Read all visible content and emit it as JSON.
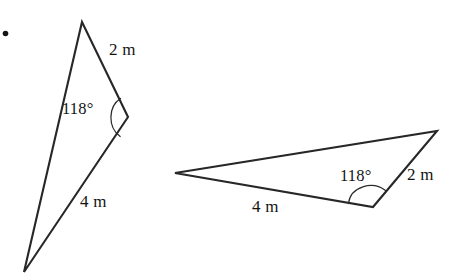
{
  "figure": {
    "background_color": "#ffffff",
    "stroke_color": "#272727",
    "text_color": "#131313",
    "width": 452,
    "height": 276,
    "bullet": {
      "symbol": "•",
      "x": 2,
      "y": 26
    }
  },
  "triangles": [
    {
      "id": "left-triangle",
      "orientation": "near-vertical, apex at top",
      "vertices": [
        {
          "name": "apex-top",
          "x": 82,
          "y": 22
        },
        {
          "name": "angle-vertex-right",
          "x": 128,
          "y": 117
        },
        {
          "name": "bottom-point",
          "x": 24,
          "y": 272
        }
      ],
      "angle": {
        "value": "118°",
        "at_vertex": "angle-vertex-right",
        "label_x": 62,
        "label_y": 102
      },
      "sides": [
        {
          "label": "2 m",
          "between": [
            "apex-top",
            "angle-vertex-right"
          ],
          "label_x": 108,
          "label_y": 42
        },
        {
          "label": "4 m",
          "between": [
            "angle-vertex-right",
            "bottom-point"
          ],
          "label_x": 80,
          "label_y": 194
        }
      ]
    },
    {
      "id": "right-triangle",
      "orientation": "near-horizontal, long side to the left",
      "vertices": [
        {
          "name": "left-point",
          "x": 175,
          "y": 173
        },
        {
          "name": "top-right",
          "x": 437,
          "y": 131
        },
        {
          "name": "angle-vertex-bottom",
          "x": 373,
          "y": 207
        }
      ],
      "angle": {
        "value": "118°",
        "at_vertex": "angle-vertex-bottom",
        "label_x": 340,
        "label_y": 169
      },
      "sides": [
        {
          "label": "2 m",
          "between": [
            "top-right",
            "angle-vertex-bottom"
          ],
          "label_x": 406,
          "label_y": 167
        },
        {
          "label": "4 m",
          "between": [
            "angle-vertex-bottom",
            "left-point"
          ],
          "label_x": 252,
          "label_y": 199
        }
      ]
    }
  ],
  "labels": {
    "left_angle": "118°",
    "left_side_short": "2 m",
    "left_side_long": "4 m",
    "right_angle": "118°",
    "right_side_short": "2 m",
    "right_side_long": "4 m"
  }
}
